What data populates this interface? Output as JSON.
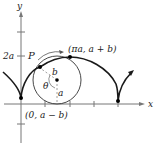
{
  "diagram": {
    "type": "prolate-cycloid",
    "colors": {
      "curve": "#1a1a1a",
      "axis": "#777777",
      "circle": "#333333",
      "dashed": "#888888",
      "point": "#000000",
      "background": "#ffffff"
    },
    "axes": {
      "x_label": "x",
      "y_label": "y",
      "y_tick_label": "2a"
    },
    "labels": {
      "point_p": "P",
      "apex_point": "(πa, a + b)",
      "start_point": "(0, a − b)",
      "radius_b": "b",
      "radius_a": "a",
      "angle": "θ"
    }
  }
}
